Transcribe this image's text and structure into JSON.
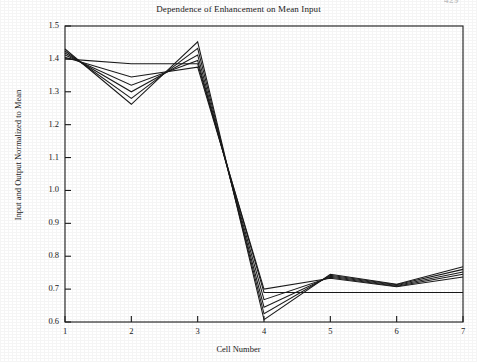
{
  "page": {
    "page_number": "429"
  },
  "chart_data": {
    "type": "line",
    "title": "Dependence of Enhancement on Mean Input",
    "xlabel": "Cell Number",
    "ylabel": "Input and Output Normalized to Mean",
    "x": [
      1,
      2,
      3,
      4,
      5,
      6,
      7
    ],
    "xtick_labels": [
      "1",
      "2",
      "3",
      "4",
      "5",
      "6",
      "7"
    ],
    "ytick_labels": [
      "0.6",
      "0.7",
      "0.8",
      "0.9",
      "1.0",
      "1.1",
      "1.2",
      "1.3",
      "1.4",
      "1.5"
    ],
    "ytick_values": [
      0.6,
      0.7,
      0.8,
      0.9,
      1.0,
      1.1,
      1.2,
      1.3,
      1.4,
      1.5
    ],
    "xlim": [
      1,
      7
    ],
    "ylim": [
      0.6,
      1.5
    ],
    "grid": false,
    "legend": "none",
    "line_color": "#1a1a1a",
    "series": [
      {
        "name": "input",
        "values": [
          1.4,
          1.385,
          1.385,
          0.69,
          0.69,
          0.69,
          0.69
        ]
      },
      {
        "name": "output-1",
        "values": [
          1.405,
          1.345,
          1.375,
          0.7,
          0.733,
          0.707,
          0.737
        ]
      },
      {
        "name": "output-2",
        "values": [
          1.412,
          1.32,
          1.395,
          0.668,
          0.736,
          0.709,
          0.745
        ]
      },
      {
        "name": "output-3",
        "values": [
          1.418,
          1.3,
          1.412,
          0.645,
          0.739,
          0.711,
          0.752
        ]
      },
      {
        "name": "output-4",
        "values": [
          1.424,
          1.28,
          1.432,
          0.625,
          0.742,
          0.713,
          0.76
        ]
      },
      {
        "name": "output-5",
        "values": [
          1.43,
          1.262,
          1.452,
          0.607,
          0.745,
          0.715,
          0.768
        ]
      }
    ]
  }
}
